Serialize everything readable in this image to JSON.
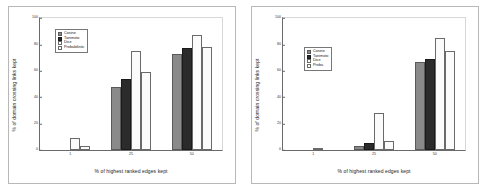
{
  "figure": {
    "panels": [
      "left",
      "right"
    ]
  },
  "chart_data": [
    {
      "type": "bar",
      "panel": "left",
      "title": "",
      "xlabel": "% of highest ranked edges kept",
      "ylabel": "% of domain crossing links kept",
      "categories": [
        "1",
        "25",
        "50"
      ],
      "xticklabels": [
        "1",
        "25",
        "50"
      ],
      "yticklabels": [
        "0",
        "20",
        "40",
        "60",
        "80",
        "100"
      ],
      "yticks": [
        0,
        20,
        40,
        60,
        80,
        100
      ],
      "ylim": [
        0,
        100
      ],
      "grid": false,
      "legend_position": "upper left",
      "series": [
        {
          "name": "Cosine",
          "color": "#8a8a8a",
          "values": [
            0,
            48,
            73
          ]
        },
        {
          "name": "Tanimoto",
          "color": "#2b2b2b",
          "values": [
            0,
            54,
            77
          ]
        },
        {
          "name": "Dice",
          "color": "#fbfbfb",
          "values": [
            9,
            75,
            87
          ]
        },
        {
          "name": "Probabilistic",
          "color": "#fbfbfb",
          "values": [
            3,
            59,
            78
          ]
        }
      ]
    },
    {
      "type": "bar",
      "panel": "right",
      "title": "",
      "xlabel": "% of highest ranked edges kept",
      "ylabel": "% of domain crossing links kept",
      "categories": [
        "1",
        "25",
        "50"
      ],
      "xticklabels": [
        "1",
        "25",
        "50"
      ],
      "yticklabels": [
        "0",
        "20",
        "40",
        "60",
        "80",
        "100"
      ],
      "yticks": [
        0,
        20,
        40,
        60,
        80,
        100
      ],
      "ylim": [
        0,
        100
      ],
      "grid": false,
      "legend_position": "upper left",
      "series": [
        {
          "name": "Cosine",
          "color": "#8a8a8a",
          "values": [
            0,
            3,
            67
          ]
        },
        {
          "name": "Tanimoto",
          "color": "#2b2b2b",
          "values": [
            0,
            5,
            69
          ]
        },
        {
          "name": "Dice",
          "color": "#fbfbfb",
          "values": [
            1,
            28,
            85
          ]
        },
        {
          "name": "Proba",
          "color": "#fbfbfb",
          "values": [
            0,
            7,
            75
          ]
        }
      ]
    }
  ]
}
